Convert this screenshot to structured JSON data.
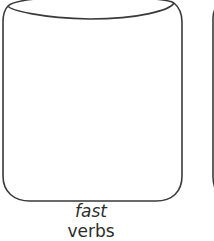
{
  "diagram": {
    "containers": [
      {
        "label_lines": [
          "fast",
          "verbs"
        ],
        "stroke": "#3a3a3a",
        "fill": "#ffffff"
      },
      {
        "label_lines": [],
        "stroke": "#3a3a3a",
        "fill": "#ffffff",
        "partially_visible": true
      }
    ]
  }
}
